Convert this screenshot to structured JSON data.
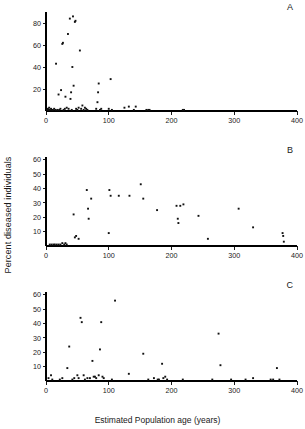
{
  "figure": {
    "ylabel": "Percent diseased individuals",
    "xlabel": "Estimated Population age (years)"
  },
  "chart_data": [
    {
      "type": "scatter",
      "panel": "A",
      "title": "",
      "xlabel": "Estimated Population age (years)",
      "ylabel": "Percent diseased individuals",
      "xlim": [
        0,
        400
      ],
      "ylim": [
        0,
        90
      ],
      "xticks": [
        0,
        100,
        200,
        300,
        400
      ],
      "yticks": [
        20,
        40,
        60,
        80
      ],
      "grid": false,
      "legend": null,
      "points": [
        [
          2,
          1
        ],
        [
          3,
          2
        ],
        [
          4,
          1
        ],
        [
          5,
          3
        ],
        [
          6,
          1
        ],
        [
          8,
          2
        ],
        [
          9,
          1
        ],
        [
          11,
          1
        ],
        [
          13,
          2
        ],
        [
          15,
          1
        ],
        [
          16,
          43
        ],
        [
          18,
          1
        ],
        [
          20,
          15
        ],
        [
          21,
          1
        ],
        [
          23,
          2
        ],
        [
          24,
          19
        ],
        [
          26,
          61
        ],
        [
          27,
          62
        ],
        [
          28,
          1
        ],
        [
          30,
          2
        ],
        [
          31,
          13
        ],
        [
          33,
          3
        ],
        [
          35,
          70
        ],
        [
          36,
          2
        ],
        [
          38,
          84
        ],
        [
          39,
          11
        ],
        [
          40,
          17
        ],
        [
          41,
          1
        ],
        [
          42,
          40
        ],
        [
          43,
          86
        ],
        [
          44,
          23
        ],
        [
          46,
          81
        ],
        [
          47,
          82
        ],
        [
          48,
          2
        ],
        [
          50,
          1
        ],
        [
          52,
          3
        ],
        [
          54,
          55
        ],
        [
          56,
          2
        ],
        [
          58,
          5
        ],
        [
          60,
          1
        ],
        [
          62,
          3
        ],
        [
          64,
          2
        ],
        [
          66,
          1
        ],
        [
          80,
          2
        ],
        [
          82,
          8
        ],
        [
          83,
          17
        ],
        [
          84,
          25
        ],
        [
          86,
          1
        ],
        [
          88,
          2
        ],
        [
          100,
          2
        ],
        [
          103,
          29
        ],
        [
          105,
          1
        ],
        [
          125,
          3
        ],
        [
          132,
          4
        ],
        [
          140,
          1
        ],
        [
          143,
          4
        ],
        [
          160,
          1
        ],
        [
          163,
          1
        ],
        [
          165,
          1
        ],
        [
          218,
          1
        ],
        [
          220,
          1
        ]
      ]
    },
    {
      "type": "scatter",
      "panel": "B",
      "title": "",
      "xlabel": "Estimated Population age (years)",
      "ylabel": "Percent diseased individuals",
      "xlim": [
        0,
        400
      ],
      "ylim": [
        0,
        62
      ],
      "xticks": [
        0,
        100,
        200,
        300,
        400
      ],
      "yticks": [
        10,
        20,
        30,
        40,
        50,
        60
      ],
      "grid": false,
      "legend": null,
      "points": [
        [
          6,
          1
        ],
        [
          9,
          1
        ],
        [
          12,
          1
        ],
        [
          14,
          1
        ],
        [
          17,
          1
        ],
        [
          20,
          1
        ],
        [
          23,
          1
        ],
        [
          26,
          2
        ],
        [
          29,
          1
        ],
        [
          31,
          2
        ],
        [
          33,
          1
        ],
        [
          44,
          22
        ],
        [
          46,
          6
        ],
        [
          48,
          7
        ],
        [
          52,
          5
        ],
        [
          65,
          39
        ],
        [
          67,
          26
        ],
        [
          68,
          19
        ],
        [
          72,
          33
        ],
        [
          100,
          9
        ],
        [
          101,
          39
        ],
        [
          103,
          35
        ],
        [
          116,
          35
        ],
        [
          133,
          35
        ],
        [
          151,
          43
        ],
        [
          155,
          33
        ],
        [
          177,
          25
        ],
        [
          208,
          28
        ],
        [
          210,
          19
        ],
        [
          211,
          16
        ],
        [
          214,
          28
        ],
        [
          219,
          29
        ],
        [
          243,
          21
        ],
        [
          258,
          5
        ],
        [
          307,
          26
        ],
        [
          330,
          13
        ],
        [
          377,
          9
        ],
        [
          378,
          7
        ],
        [
          379,
          3
        ]
      ]
    },
    {
      "type": "scatter",
      "panel": "C",
      "title": "",
      "xlabel": "Estimated Population age (years)",
      "ylabel": "Percent diseased individuals",
      "xlim": [
        0,
        400
      ],
      "ylim": [
        0,
        62
      ],
      "xticks": [
        0,
        100,
        200,
        300,
        400
      ],
      "yticks": [
        10,
        20,
        30,
        40,
        50,
        60
      ],
      "grid": false,
      "legend": null,
      "points": [
        [
          4,
          2
        ],
        [
          8,
          4
        ],
        [
          10,
          1
        ],
        [
          22,
          1
        ],
        [
          26,
          2
        ],
        [
          34,
          9
        ],
        [
          37,
          24
        ],
        [
          42,
          1
        ],
        [
          45,
          2
        ],
        [
          50,
          4
        ],
        [
          52,
          2
        ],
        [
          55,
          44
        ],
        [
          57,
          41
        ],
        [
          60,
          4
        ],
        [
          62,
          1
        ],
        [
          66,
          2
        ],
        [
          70,
          2
        ],
        [
          74,
          14
        ],
        [
          76,
          3
        ],
        [
          78,
          3
        ],
        [
          80,
          2
        ],
        [
          84,
          4
        ],
        [
          86,
          22
        ],
        [
          88,
          41
        ],
        [
          90,
          3
        ],
        [
          92,
          2
        ],
        [
          105,
          1
        ],
        [
          110,
          56
        ],
        [
          132,
          5
        ],
        [
          155,
          19
        ],
        [
          163,
          1
        ],
        [
          172,
          2
        ],
        [
          178,
          1
        ],
        [
          180,
          1
        ],
        [
          185,
          12
        ],
        [
          187,
          2
        ],
        [
          190,
          3
        ],
        [
          193,
          1
        ],
        [
          218,
          1
        ],
        [
          265,
          1
        ],
        [
          275,
          33
        ],
        [
          278,
          11
        ],
        [
          295,
          1
        ],
        [
          318,
          1
        ],
        [
          330,
          2
        ],
        [
          358,
          1
        ],
        [
          362,
          1
        ],
        [
          368,
          9
        ],
        [
          372,
          1
        ]
      ]
    }
  ]
}
